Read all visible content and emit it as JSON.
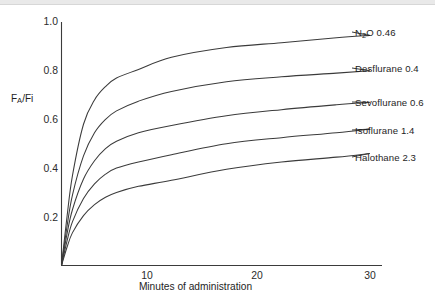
{
  "figure": {
    "background_color": "#ffffff",
    "line_color": "#3b3b3b",
    "top_rule_color": "#e9e9e9"
  },
  "chart_data": {
    "type": "line",
    "title": "",
    "xlabel": "Minutes of administration",
    "ylabel": "FA/Fi",
    "ylabel_parts": {
      "main1": "F",
      "sub": "A",
      "main2": "/Fi"
    },
    "xlim": [
      0,
      30
    ],
    "ylim": [
      0,
      1.0
    ],
    "grid": false,
    "legend_position": "right-inline-labels",
    "xticks": [
      10,
      20,
      30
    ],
    "xtick_labels": [
      "10",
      "20",
      "30"
    ],
    "yticks": [
      0.2,
      0.4,
      0.6,
      0.8,
      1.0
    ],
    "ytick_labels": [
      "0.2",
      "0.4",
      "0.6",
      "0.8",
      "1.0"
    ],
    "x": [
      0,
      0.5,
      1,
      2,
      3,
      4,
      5,
      7,
      10,
      15,
      20,
      25,
      28
    ],
    "series": [
      {
        "name": "N2O 0.46",
        "label": "N₂O 0.46",
        "agent": "N2O",
        "blood_gas_coefficient": 0.46,
        "values": [
          0.0,
          0.2,
          0.37,
          0.58,
          0.68,
          0.735,
          0.77,
          0.805,
          0.855,
          0.895,
          0.915,
          0.935,
          0.945
        ]
      },
      {
        "name": "Desflurane 0.4",
        "label": "Desflurane 0.4",
        "agent": "Desflurane",
        "blood_gas_coefficient": 0.4,
        "values": [
          0.0,
          0.16,
          0.29,
          0.45,
          0.545,
          0.6,
          0.635,
          0.675,
          0.715,
          0.755,
          0.775,
          0.79,
          0.8
        ]
      },
      {
        "name": "Sevoflurane 0.6",
        "label": "Sevoflurane 0.6",
        "agent": "Sevoflurane",
        "blood_gas_coefficient": 0.6,
        "values": [
          0.0,
          0.13,
          0.23,
          0.355,
          0.43,
          0.48,
          0.51,
          0.545,
          0.575,
          0.615,
          0.64,
          0.66,
          0.67
        ]
      },
      {
        "name": "Isoflurane 1.4",
        "label": "Isoflurane 1.4",
        "agent": "Isoflurane",
        "blood_gas_coefficient": 1.4,
        "values": [
          0.0,
          0.1,
          0.18,
          0.275,
          0.335,
          0.375,
          0.4,
          0.425,
          0.455,
          0.5,
          0.525,
          0.545,
          0.56
        ]
      },
      {
        "name": "Halothane 2.3",
        "label": "Halothane 2.3",
        "agent": "Halothane",
        "blood_gas_coefficient": 2.3,
        "values": [
          0.0,
          0.075,
          0.135,
          0.205,
          0.25,
          0.28,
          0.3,
          0.325,
          0.35,
          0.395,
          0.425,
          0.445,
          0.46
        ]
      }
    ],
    "annotations": [
      {
        "text": "N₂O 0.46",
        "at_x": 28,
        "at_y": 0.945
      },
      {
        "text": "Desflurane 0.4",
        "at_x": 28,
        "at_y": 0.8
      },
      {
        "text": "Sevoflurane 0.6",
        "at_x": 28,
        "at_y": 0.67
      },
      {
        "text": "Isoflurane 1.4",
        "at_x": 28,
        "at_y": 0.56
      },
      {
        "text": "Halothane 2.3",
        "at_x": 28,
        "at_y": 0.46
      }
    ]
  }
}
